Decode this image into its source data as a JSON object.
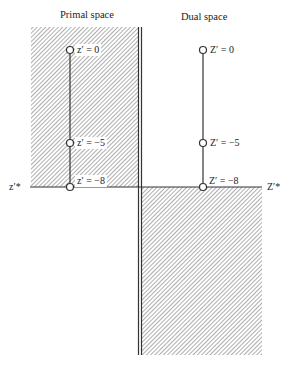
{
  "titles": {
    "primal": "Primal space",
    "dual": "Dual space"
  },
  "primal": {
    "points": [
      {
        "label": "z′ = 0",
        "value": 0
      },
      {
        "label": "z′ = −5",
        "value": -5
      },
      {
        "label": "z′ = −8",
        "value": -8
      }
    ],
    "axis_label": "z′*"
  },
  "dual": {
    "points": [
      {
        "label": "Z′ = 0",
        "value": 0
      },
      {
        "label": "Z′ = −5",
        "value": -5
      },
      {
        "label": "Z′ = −8",
        "value": -8
      }
    ],
    "axis_label": "Z′*"
  },
  "colors": {
    "line": "#333333",
    "hatch": "#555555"
  }
}
